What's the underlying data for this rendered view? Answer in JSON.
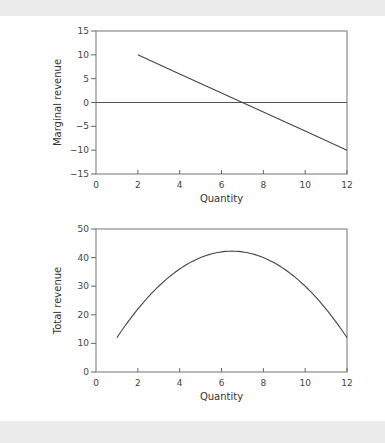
{
  "chart_data": [
    {
      "type": "line",
      "title": "",
      "xlabel": "Quantity",
      "ylabel": "Marginal revenue",
      "xlim": [
        0,
        12
      ],
      "ylim": [
        -15,
        15
      ],
      "xticks": [
        0,
        2,
        4,
        6,
        8,
        10,
        12
      ],
      "yticks": [
        -15,
        -10,
        -5,
        0,
        5,
        10,
        15
      ],
      "ytick_labels": [
        "−15",
        "−10",
        "−5",
        "0",
        "5",
        "10",
        "15"
      ],
      "grid": false,
      "reference_lines": [
        {
          "axis": "y",
          "value": 0
        }
      ],
      "series": [
        {
          "name": "Marginal revenue",
          "x": [
            2,
            4,
            6,
            7,
            8,
            10,
            12
          ],
          "y": [
            10,
            6,
            2,
            0,
            -2,
            -6,
            -10
          ]
        }
      ],
      "frame": {
        "left": 96,
        "right": 347,
        "top": 31,
        "bottom": 174
      }
    },
    {
      "type": "line",
      "title": "",
      "xlabel": "Quantity",
      "ylabel": "Total revenue",
      "xlim": [
        0,
        12
      ],
      "ylim": [
        0,
        50
      ],
      "xticks": [
        0,
        2,
        4,
        6,
        8,
        10,
        12
      ],
      "yticks": [
        0,
        10,
        20,
        30,
        40,
        50
      ],
      "ytick_labels": [
        "0",
        "10",
        "20",
        "30",
        "40",
        "50"
      ],
      "grid": false,
      "series": [
        {
          "name": "Total revenue",
          "x": [
            1,
            2,
            3,
            4,
            5,
            6,
            6.5,
            7,
            8,
            9,
            10,
            11,
            12
          ],
          "y": [
            12,
            22,
            30,
            36,
            40,
            42,
            42.25,
            42,
            40,
            36,
            30,
            22,
            12
          ]
        }
      ],
      "frame": {
        "left": 96,
        "right": 347,
        "top": 229,
        "bottom": 372
      }
    }
  ]
}
